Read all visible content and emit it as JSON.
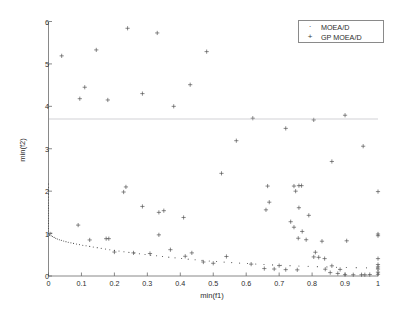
{
  "figure": {
    "background_color": "#ffffff",
    "axis_color": "#6b6b6b",
    "text_color": "#2c2c2c"
  },
  "axes": {
    "x_label": "min(f1)",
    "y_label": "min(f2)",
    "x_ticks": [
      "0",
      "0.1",
      "0.2",
      "0.3",
      "0.4",
      "0.5",
      "0.6",
      "0.7",
      "0.8",
      "0.9",
      "1"
    ],
    "y_ticks": [
      "0",
      "1",
      "2",
      "3",
      "4",
      "5",
      "6"
    ]
  },
  "legend": {
    "position": "top-right",
    "entries": [
      {
        "label": "MOEA/D",
        "marker": "dot"
      },
      {
        "label": "GP MOEA/D",
        "marker": "plus"
      }
    ]
  },
  "chart_data": {
    "type": "scatter",
    "title": "",
    "xlabel": "min(f1)",
    "ylabel": "min(f2)",
    "xlim": [
      0,
      1
    ],
    "ylim": [
      0,
      6
    ],
    "xticks": [
      0,
      0.1,
      0.2,
      0.3,
      0.4,
      0.5,
      0.6,
      0.7,
      0.8,
      0.9,
      1
    ],
    "yticks": [
      0,
      1,
      2,
      3,
      4,
      5,
      6
    ],
    "grid": false,
    "legend_position": "upper right",
    "series": [
      {
        "name": "MOEA/D",
        "marker": "dot",
        "color": "#4a4a4a",
        "points": [
          [
            0.0,
            1.0
          ],
          [
            0.004,
            0.975
          ],
          [
            0.008,
            0.95
          ],
          [
            0.012,
            0.93
          ],
          [
            0.017,
            0.91
          ],
          [
            0.022,
            0.89
          ],
          [
            0.027,
            0.872
          ],
          [
            0.033,
            0.856
          ],
          [
            0.039,
            0.84
          ],
          [
            0.046,
            0.824
          ],
          [
            0.053,
            0.81
          ],
          [
            0.06,
            0.796
          ],
          [
            0.068,
            0.782
          ],
          [
            0.076,
            0.768
          ],
          [
            0.085,
            0.754
          ],
          [
            0.094,
            0.74
          ],
          [
            0.104,
            0.726
          ],
          [
            0.114,
            0.712
          ],
          [
            0.125,
            0.698
          ],
          [
            0.136,
            0.684
          ],
          [
            0.148,
            0.668
          ],
          [
            0.16,
            0.652
          ],
          [
            0.173,
            0.636
          ],
          [
            0.186,
            0.62
          ],
          [
            0.2,
            0.604
          ],
          [
            0.214,
            0.588
          ],
          [
            0.229,
            0.572
          ],
          [
            0.244,
            0.556
          ],
          [
            0.26,
            0.54
          ],
          [
            0.276,
            0.524
          ],
          [
            0.293,
            0.508
          ],
          [
            0.31,
            0.492
          ],
          [
            0.328,
            0.476
          ],
          [
            0.346,
            0.46
          ],
          [
            0.365,
            0.444
          ],
          [
            0.384,
            0.428
          ],
          [
            0.404,
            0.412
          ],
          [
            0.424,
            0.397
          ],
          [
            0.445,
            0.382
          ],
          [
            0.466,
            0.368
          ],
          [
            0.488,
            0.354
          ],
          [
            0.51,
            0.341
          ],
          [
            0.533,
            0.328
          ],
          [
            0.556,
            0.316
          ],
          [
            0.58,
            0.304
          ],
          [
            0.604,
            0.293
          ],
          [
            0.629,
            0.282
          ],
          [
            0.654,
            0.272
          ],
          [
            0.68,
            0.262
          ],
          [
            0.706,
            0.253
          ],
          [
            0.733,
            0.244
          ],
          [
            0.76,
            0.236
          ],
          [
            0.788,
            0.228
          ],
          [
            0.816,
            0.221
          ],
          [
            0.845,
            0.214
          ],
          [
            0.874,
            0.208
          ],
          [
            0.904,
            0.202
          ],
          [
            0.934,
            0.197
          ],
          [
            0.965,
            0.192
          ],
          [
            0.996,
            0.188
          ],
          [
            0.0,
            1.06
          ],
          [
            0.0,
            1.12
          ],
          [
            0.0,
            1.18
          ],
          [
            0.0,
            1.24
          ],
          [
            0.0,
            1.3
          ],
          [
            0.0,
            1.36
          ],
          [
            0.0,
            1.42
          ],
          [
            0.0,
            1.48
          ],
          [
            0.0,
            1.54
          ],
          [
            0.0,
            1.6
          ],
          [
            0.0,
            1.66
          ],
          [
            0.0,
            1.72
          ],
          [
            0.0,
            1.79
          ],
          [
            0.0,
            1.86
          ],
          [
            0.0,
            1.93
          ],
          [
            0.0,
            2.01
          ],
          [
            0.0,
            2.09
          ],
          [
            0.0,
            2.17
          ],
          [
            0.005,
            1.03
          ],
          [
            0.005,
            0.995
          ],
          [
            0.01,
            1.01
          ],
          [
            0.003,
            0.96
          ]
        ]
      },
      {
        "name": "GP MOEA/D",
        "marker": "plus",
        "color": "#4a4a4a",
        "points": [
          [
            0.04,
            5.19
          ],
          [
            0.145,
            5.33
          ],
          [
            0.24,
            5.84
          ],
          [
            0.33,
            5.73
          ],
          [
            0.48,
            5.29
          ],
          [
            0.11,
            4.45
          ],
          [
            0.43,
            4.51
          ],
          [
            0.095,
            4.18
          ],
          [
            0.18,
            4.15
          ],
          [
            0.285,
            4.3
          ],
          [
            0.38,
            4.0
          ],
          [
            0.62,
            3.72
          ],
          [
            0.805,
            3.68
          ],
          [
            0.9,
            3.79
          ],
          [
            0.72,
            3.48
          ],
          [
            0.57,
            3.19
          ],
          [
            0.955,
            3.06
          ],
          [
            0.86,
            2.7
          ],
          [
            0.525,
            2.42
          ],
          [
            0.235,
            2.1
          ],
          [
            0.228,
            1.98
          ],
          [
            0.665,
            2.12
          ],
          [
            0.745,
            2.12
          ],
          [
            0.768,
            2.13
          ],
          [
            0.76,
            2.13
          ],
          [
            1.0,
            1.99
          ],
          [
            0.75,
            2.0
          ],
          [
            0.67,
            1.74
          ],
          [
            0.76,
            1.61
          ],
          [
            0.285,
            1.64
          ],
          [
            0.66,
            1.56
          ],
          [
            0.35,
            1.54
          ],
          [
            0.335,
            1.5
          ],
          [
            0.41,
            1.38
          ],
          [
            0.79,
            1.43
          ],
          [
            0.735,
            1.28
          ],
          [
            0.745,
            1.15
          ],
          [
            0.09,
            1.2
          ],
          [
            0.77,
            1.05
          ],
          [
            0.335,
            0.97
          ],
          [
            0.758,
            0.89
          ],
          [
            0.782,
            0.855
          ],
          [
            0.125,
            0.85
          ],
          [
            0.175,
            0.88
          ],
          [
            0.183,
            0.88
          ],
          [
            1.0,
            0.95
          ],
          [
            1.0,
            0.99
          ],
          [
            0.83,
            0.82
          ],
          [
            0.905,
            0.83
          ],
          [
            0.37,
            0.62
          ],
          [
            0.435,
            0.545
          ],
          [
            0.81,
            0.56
          ],
          [
            0.805,
            0.45
          ],
          [
            0.82,
            0.44
          ],
          [
            0.838,
            0.41
          ],
          [
            0.615,
            0.28
          ],
          [
            0.7,
            0.245
          ],
          [
            0.54,
            0.46
          ],
          [
            0.415,
            0.465
          ],
          [
            0.308,
            0.53
          ],
          [
            0.72,
            0.15
          ],
          [
            0.755,
            0.145
          ],
          [
            0.86,
            0.24
          ],
          [
            0.885,
            0.155
          ],
          [
            0.84,
            0.16
          ],
          [
            1.0,
            0.41
          ],
          [
            1.0,
            0.27
          ],
          [
            1.0,
            0.215
          ],
          [
            1.0,
            0.165
          ],
          [
            1.0,
            0.09
          ],
          [
            1.0,
            0.04
          ],
          [
            0.975,
            0.035
          ],
          [
            0.95,
            0.03
          ],
          [
            0.925,
            0.03
          ],
          [
            0.9,
            0.032
          ],
          [
            0.96,
            0.03
          ],
          [
            0.878,
            0.06
          ],
          [
            0.855,
            0.08
          ],
          [
            0.2,
            0.565
          ],
          [
            0.258,
            0.545
          ],
          [
            0.47,
            0.33
          ],
          [
            0.5,
            0.3
          ],
          [
            0.655,
            0.175
          ],
          [
            0.685,
            0.165
          ]
        ]
      }
    ]
  }
}
